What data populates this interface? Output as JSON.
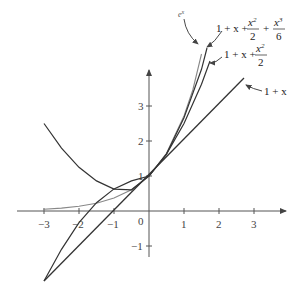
{
  "diagram": {
    "x_ticks": [
      "−3",
      "−2",
      "−1",
      "0",
      "1",
      "2",
      "3"
    ],
    "y_ticks": [
      "−1",
      "1",
      "2",
      "3"
    ],
    "labels": {
      "ex": "e",
      "ex_sup": "x",
      "p1": "1 + x",
      "p2_prefix": "1 + x +",
      "p2_num": "x",
      "p2_num_sup": "2",
      "p2_den": "2",
      "p3_prefix": "1 + x +",
      "p3_num1": "x",
      "p3_num1_sup": "2",
      "p3_den1": "2",
      "p3_plus": "+",
      "p3_num2": "x",
      "p3_num2_sup": "3",
      "p3_den2": "6"
    },
    "colors": {
      "curve": "#333333",
      "ex_curve": "#888888",
      "axis": "#555555"
    }
  }
}
